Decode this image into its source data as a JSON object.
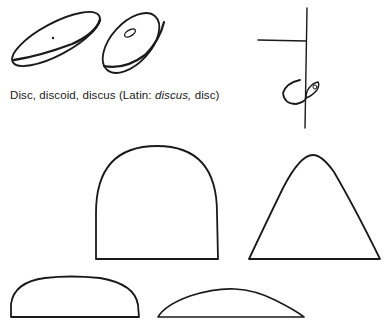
{
  "caption": {
    "term": "Disc, discoid, discus (Latin: ",
    "latin": "discus,",
    "gloss": " disc)"
  },
  "figures": [
    {
      "id": "disc-dotted",
      "shape": "tilted-ellipse-disc",
      "marking": "center-dot"
    },
    {
      "id": "disc-holed",
      "shape": "tilted-ellipse-disc",
      "marking": "small-oval-hole"
    },
    {
      "id": "stem-hook",
      "shape": "vertical-line-with-side-branch-and-hook"
    },
    {
      "id": "dome-tall",
      "shape": "semicircular-dome"
    },
    {
      "id": "bell",
      "shape": "bell-peak"
    },
    {
      "id": "dome-flat",
      "shape": "flattened-dome"
    },
    {
      "id": "arc-low",
      "shape": "low-arc-segment"
    }
  ],
  "colors": {
    "ink": "#1a1a1a",
    "paper": "#ffffff"
  }
}
